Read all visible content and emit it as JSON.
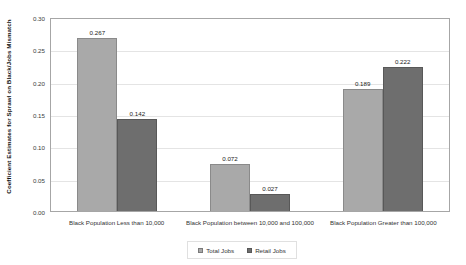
{
  "chart_data": {
    "type": "bar",
    "title": "",
    "xlabel": "",
    "ylabel": "Coefficient Estimates for Sprawl on Black/Jobs Mismatch",
    "ylim": [
      0.0,
      0.3
    ],
    "ytick_labels": [
      "0.30",
      "0.25",
      "0.20",
      "0.15",
      "0.10",
      "0.05",
      "0.00"
    ],
    "ytick_values": [
      0.3,
      0.25,
      0.2,
      0.15,
      0.1,
      0.05,
      0.0
    ],
    "grid": true,
    "legend_position": "bottom-center",
    "categories": [
      "Black Population Less than 10,000",
      "Black Population between 10,000 and 100,000",
      "Black Population Greater than 100,000"
    ],
    "series": [
      {
        "name": "Total Jobs",
        "color": "#a9a9a9",
        "values": [
          0.267,
          0.072,
          0.189
        ],
        "labels": [
          "0.267",
          "0.072",
          "0.189"
        ]
      },
      {
        "name": "Retail Jobs",
        "color": "#6e6e6e",
        "values": [
          0.142,
          0.027,
          0.222
        ],
        "labels": [
          "0.142",
          "0.027",
          "0.222"
        ]
      }
    ]
  }
}
